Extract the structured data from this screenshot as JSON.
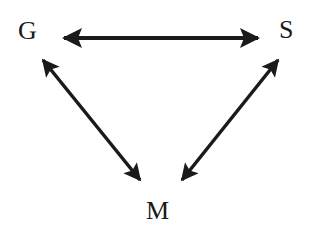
{
  "diagram": {
    "nodes": [
      {
        "id": "G",
        "label": "G"
      },
      {
        "id": "S",
        "label": "S"
      },
      {
        "id": "M",
        "label": "M"
      }
    ],
    "edges": [
      {
        "from": "G",
        "to": "S",
        "direction": "bidirectional"
      },
      {
        "from": "G",
        "to": "M",
        "direction": "bidirectional"
      },
      {
        "from": "S",
        "to": "M",
        "direction": "bidirectional"
      }
    ],
    "colors": {
      "ink": "#1a1a1a",
      "background": "#ffffff"
    }
  }
}
